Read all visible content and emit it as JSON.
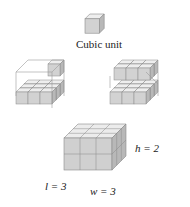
{
  "figure": {
    "unit_label": "Cubic unit",
    "dimensions": {
      "l": "l = 3",
      "w": "w = 3",
      "h": "h = 2"
    },
    "panels": [
      {
        "name": "unit-cube",
        "description": "single cubic unit"
      },
      {
        "name": "box-partial-1",
        "description": "box outline with first layer of 9 cubes and one cube on second layer"
      },
      {
        "name": "box-partial-2",
        "description": "box with first layer filled and second layer partially filled"
      },
      {
        "name": "box-full",
        "description": "3 by 3 by 2 box of cubes"
      }
    ],
    "colors": {
      "top": "#ececec",
      "front": "#cfcfcf",
      "side": "#b9b9b9",
      "edge": "#8a8a8a"
    }
  }
}
